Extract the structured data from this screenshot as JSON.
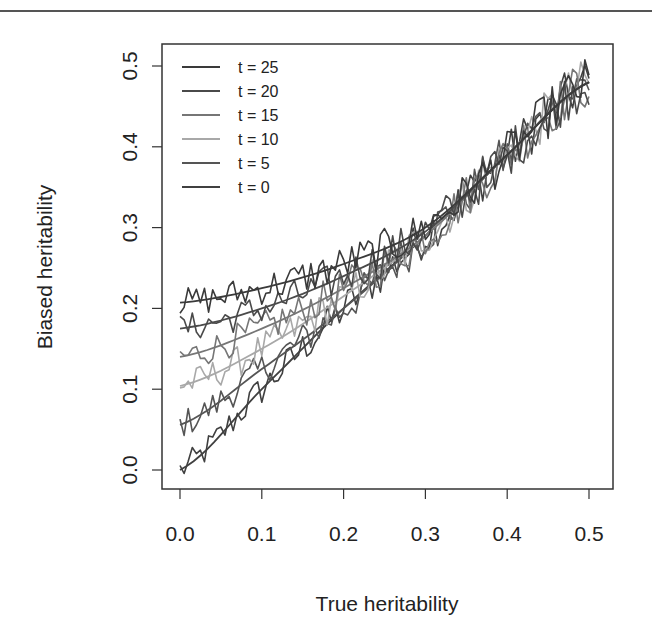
{
  "chart_data": {
    "type": "line",
    "title": "",
    "xlabel": "True heritability",
    "ylabel": "Biased heritability",
    "xlim": [
      0.0,
      0.5
    ],
    "ylim": [
      0.0,
      0.5
    ],
    "x_ticks": [
      "0.0",
      "0.1",
      "0.2",
      "0.3",
      "0.4",
      "0.5"
    ],
    "y_ticks": [
      "0.0",
      "0.1",
      "0.2",
      "0.3",
      "0.4",
      "0.5"
    ],
    "grid": false,
    "legend_position": "top-left",
    "smooth_x": [
      0.0,
      0.1,
      0.2,
      0.3,
      0.4,
      0.5
    ],
    "series": [
      {
        "name": "t = 25",
        "color": "#3a3a3a",
        "smooth": [
          0.207,
          0.225,
          0.255,
          0.3,
          0.39,
          0.48
        ],
        "noise": 0.018
      },
      {
        "name": "t = 20",
        "color": "#4a4a4a",
        "smooth": [
          0.175,
          0.2,
          0.24,
          0.295,
          0.39,
          0.48
        ],
        "noise": 0.018
      },
      {
        "name": "t = 15",
        "color": "#767676",
        "smooth": [
          0.14,
          0.175,
          0.225,
          0.29,
          0.39,
          0.48
        ],
        "noise": 0.018
      },
      {
        "name": "t = 10",
        "color": "#a8a8a8",
        "smooth": [
          0.104,
          0.15,
          0.215,
          0.29,
          0.39,
          0.48
        ],
        "noise": 0.018
      },
      {
        "name": "t = 5",
        "color": "#555555",
        "smooth": [
          0.056,
          0.125,
          0.2,
          0.29,
          0.39,
          0.48
        ],
        "noise": 0.018
      },
      {
        "name": "t = 0",
        "color": "#404040",
        "smooth": [
          0.0,
          0.1,
          0.2,
          0.29,
          0.39,
          0.48
        ],
        "noise": 0.018
      }
    ]
  },
  "layout": {
    "plot_left": 162,
    "plot_top": 44,
    "plot_right": 613,
    "plot_bottom": 489,
    "x0_px": 180,
    "x05_px": 589,
    "y0_px": 470,
    "y05_px": 66
  }
}
